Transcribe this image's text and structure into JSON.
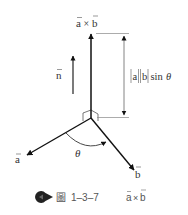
{
  "figure": {
    "labels": {
      "cross_product": "a × b",
      "cross_product_a": "a",
      "cross_product_times": "×",
      "cross_product_b": "b",
      "unit_normal": "n",
      "vector_a": "a",
      "vector_b": "b",
      "angle": "θ",
      "magnitude_a": "a",
      "magnitude_b": "b",
      "magnitude_sin": "sin",
      "magnitude_theta": "θ"
    },
    "colors": {
      "line": "#111111",
      "guide": "#888888",
      "text": "#333333",
      "caption_text": "#555555"
    }
  },
  "caption": {
    "icon": "pacman-bullet-icon",
    "figure_char": "圖",
    "number": "1–3–7",
    "formula_a": "a",
    "formula_times": "×",
    "formula_b": "b"
  }
}
